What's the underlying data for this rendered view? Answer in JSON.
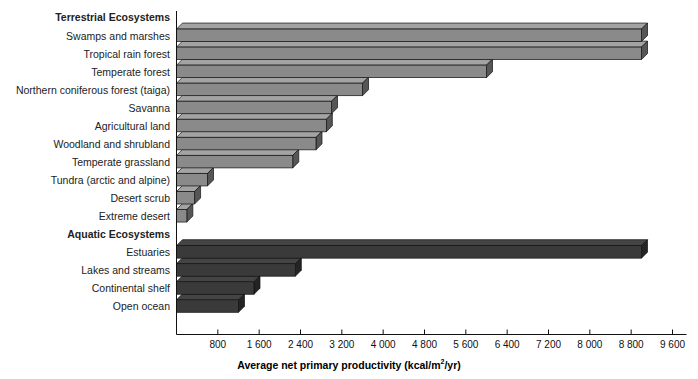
{
  "chart_data": {
    "type": "bar",
    "orientation": "horizontal",
    "title": "",
    "xlabel": "Average net primary productivity (kcal/m2/yr)",
    "xlabel_parts": {
      "before": "Average net primary productivity (kcal/m",
      "sup": "2",
      "after": "/yr)"
    },
    "ylabel": "",
    "xlim": [
      0,
      9600
    ],
    "xticks": [
      800,
      1600,
      2400,
      3200,
      4000,
      4800,
      5600,
      6400,
      7200,
      8000,
      8800,
      9600
    ],
    "xticklabels": [
      "800",
      "1 600",
      "2 400",
      "3 200",
      "4 000",
      "4 800",
      "5 600",
      "6 400",
      "7 200",
      "8 000",
      "8 800",
      "9 600"
    ],
    "grid": false,
    "legend": null,
    "groups": [
      {
        "name": "Terrestrial Ecosystems",
        "color": "#8a8a8a",
        "categories": [
          "Swamps and marshes",
          "Tropical rain forest",
          "Temperate forest",
          "Northern coniferous forest (taiga)",
          "Savanna",
          "Agricultural land",
          "Woodland and shrubland",
          "Temperate grassland",
          "Tundra (arctic and alpine)",
          "Desert scrub",
          "Extreme desert"
        ],
        "values": [
          9000,
          9000,
          6000,
          3600,
          3000,
          2900,
          2700,
          2250,
          600,
          350,
          200
        ]
      },
      {
        "name": "Aquatic Ecosystems",
        "color": "#3a3a3a",
        "categories": [
          "Estuaries",
          "Lakes and streams",
          "Continental shelf",
          "Open ocean"
        ],
        "values": [
          9000,
          2300,
          1500,
          1200
        ]
      }
    ]
  },
  "axis": {
    "x_title_before": "Average net primary productivity (kcal/m",
    "x_title_sup": "2",
    "x_title_after": "/yr)"
  }
}
